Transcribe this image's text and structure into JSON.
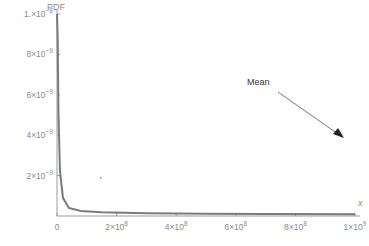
{
  "chart_data": {
    "type": "line",
    "title": "",
    "xlabel": "x",
    "ylabel": "PDF",
    "xlim": [
      0,
      1000000000
    ],
    "ylim": [
      0,
      1e-08
    ],
    "grid": false,
    "legend": null,
    "x_ticks": [
      {
        "value": 0,
        "label": "0"
      },
      {
        "value": 200000000,
        "label": "2×10",
        "exp": "8"
      },
      {
        "value": 400000000,
        "label": "4×10",
        "exp": "8"
      },
      {
        "value": 600000000,
        "label": "6×10",
        "exp": "8"
      },
      {
        "value": 800000000,
        "label": "8×10",
        "exp": "8"
      },
      {
        "value": 1000000000,
        "label": "1×10",
        "exp": "9"
      }
    ],
    "y_ticks": [
      {
        "value": 2e-09,
        "label": "2×10",
        "exp": "−9"
      },
      {
        "value": 4e-09,
        "label": "4×10",
        "exp": "−9"
      },
      {
        "value": 6e-09,
        "label": "6×10",
        "exp": "−9"
      },
      {
        "value": 8e-09,
        "label": "8×10",
        "exp": "−9"
      },
      {
        "value": 1e-08,
        "label": "1.×10",
        "exp": "−8"
      }
    ],
    "series": [
      {
        "name": "PDF",
        "color": "#7a7a7a",
        "x": [
          0,
          2000000,
          5000000,
          10000000,
          20000000,
          40000000,
          80000000,
          150000000,
          300000000,
          500000000,
          700000000,
          1000000000
        ],
        "y": [
          1e-08,
          9e-09,
          5e-09,
          2.2e-09,
          9e-10,
          4e-10,
          2.5e-10,
          1.8e-10,
          1.3e-10,
          1.1e-10,
          1e-10,
          9e-11
        ]
      }
    ],
    "annotations": [
      {
        "text": "Mean",
        "arrow_from": [
          300,
          95
        ],
        "arrow_to": [
          344,
          136
        ],
        "note": "arrow points toward mean beyond the visible x-range"
      }
    ]
  }
}
